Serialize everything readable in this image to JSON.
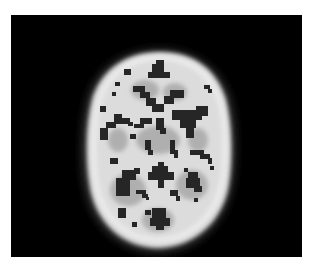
{
  "image": {
    "kind": "axial brain scan slice",
    "background_color": "#ffffff",
    "frame_color": "#000000",
    "tissue_color": "#d8d8d8",
    "gray_matter_color": "#a9a9a9",
    "void_color": "#2a2a2a"
  }
}
